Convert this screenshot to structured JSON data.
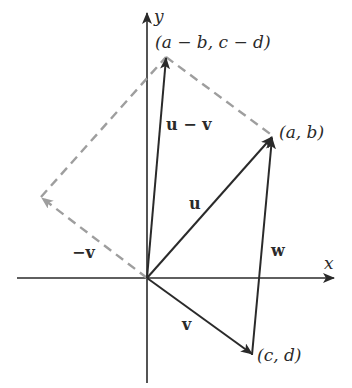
{
  "diagram": {
    "type": "vector-parallelogram",
    "colors": {
      "vector": "#2a2a2a",
      "axis": "#2a2a2a",
      "dashed": "#9e9e9e",
      "background": "#ffffff"
    },
    "axes": {
      "x_label": "x",
      "y_label": "y"
    },
    "points": {
      "ab": "(a, b)",
      "cd": "(c, d)",
      "diff": "(a − b, c − d)"
    },
    "vectors": {
      "u": "u",
      "v": "v",
      "neg_v": "−v",
      "u_minus_v": "u − v",
      "w": "w"
    }
  }
}
